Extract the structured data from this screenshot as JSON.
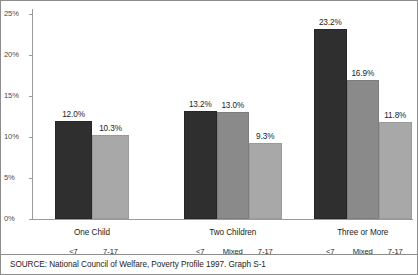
{
  "chart_data": {
    "type": "bar",
    "title": "",
    "subtitle": "",
    "xlabel": "",
    "ylabel": "",
    "ylim": [
      0,
      25
    ],
    "grid": false,
    "legend_position": "none",
    "ytick_labels": [
      "25%",
      "20%",
      "15%",
      "10%",
      "5%",
      "0%"
    ],
    "ytick_values": [
      25,
      20,
      15,
      10,
      5,
      0
    ],
    "categories": [
      "One Child",
      "Two Children",
      "Three or More"
    ],
    "series": [
      {
        "name": "<7",
        "shade": "dark",
        "color": "#2f2f2f"
      },
      {
        "name": "Mixed",
        "shade": "mid",
        "color": "#8a8a8a"
      },
      {
        "name": "7-17",
        "shade": "light",
        "color": "#a8a8a8"
      }
    ],
    "groups": [
      {
        "category": "One Child",
        "bars": [
          {
            "sub_label": "<7",
            "value": 12.0,
            "label": "12.0%",
            "shade": "dark"
          },
          {
            "sub_label": "7-17",
            "value": 10.3,
            "label": "10.3%",
            "shade": "light"
          }
        ]
      },
      {
        "category": "Two Children",
        "bars": [
          {
            "sub_label": "<7",
            "value": 13.2,
            "label": "13.2%",
            "shade": "dark"
          },
          {
            "sub_label": "Mixed",
            "value": 13.0,
            "label": "13.0%",
            "shade": "mid"
          },
          {
            "sub_label": "7-17",
            "value": 9.3,
            "label": "9.3%",
            "shade": "light"
          }
        ]
      },
      {
        "category": "Three or More",
        "bars": [
          {
            "sub_label": "<7",
            "value": 23.2,
            "label": "23.2%",
            "shade": "dark"
          },
          {
            "sub_label": "Mixed",
            "value": 16.9,
            "label": "16.9%",
            "shade": "mid"
          },
          {
            "sub_label": "7-17",
            "value": 11.8,
            "label": "11.8%",
            "shade": "light"
          }
        ]
      }
    ]
  },
  "footer": {
    "source": "SOURCE:  National Council of Welfare, Poverty Profile 1997. Graph S-1"
  }
}
